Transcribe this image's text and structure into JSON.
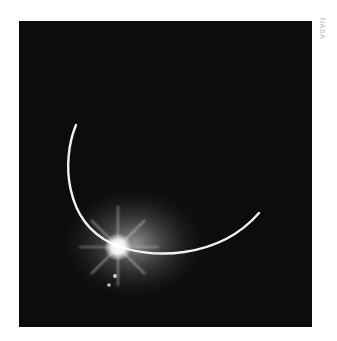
{
  "image": {
    "description": "Earth eclipsing the Sun, thin crescent of sunlit atmosphere with bright solar flare",
    "background_color": "#0c0c0c",
    "arc_color": "#f2f2f2"
  },
  "credit": {
    "text": "NASA"
  }
}
